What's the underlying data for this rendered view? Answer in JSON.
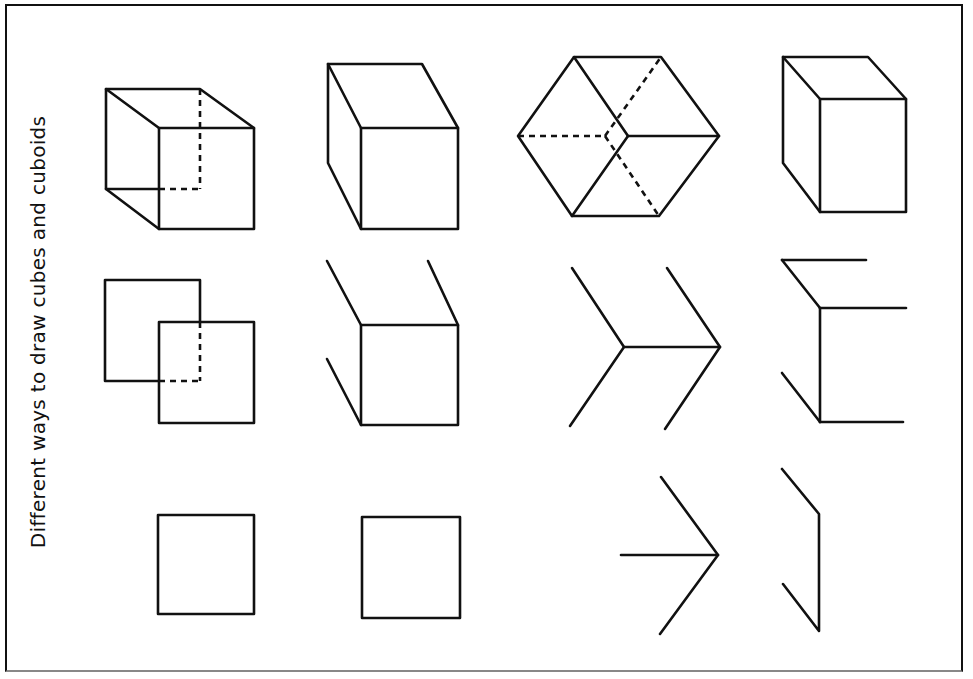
{
  "title": "Different ways to draw cubes and cuboids",
  "figures": [
    {
      "row": 1,
      "col": 1,
      "description": "wireframe cube with dashed hidden edges"
    },
    {
      "row": 1,
      "col": 2,
      "description": "solid cuboid, left side view"
    },
    {
      "row": 1,
      "col": 3,
      "description": "hexagonal isometric cube with dashed hidden edges"
    },
    {
      "row": 1,
      "col": 4,
      "description": "solid cuboid"
    },
    {
      "row": 2,
      "col": 1,
      "description": "two overlapping squares with dashed hidden corner"
    },
    {
      "row": 2,
      "col": 2,
      "description": "square with three oblique edges"
    },
    {
      "row": 2,
      "col": 3,
      "description": "isometric edge construction (two chevrons)"
    },
    {
      "row": 2,
      "col": 4,
      "description": "partial cuboid construction lines"
    },
    {
      "row": 3,
      "col": 1,
      "description": "square (front face)"
    },
    {
      "row": 3,
      "col": 2,
      "description": "square (front face)"
    },
    {
      "row": 3,
      "col": 3,
      "description": "arrow-shaped isometric start"
    },
    {
      "row": 3,
      "col": 4,
      "description": "vertical edge with two oblique lines"
    }
  ]
}
